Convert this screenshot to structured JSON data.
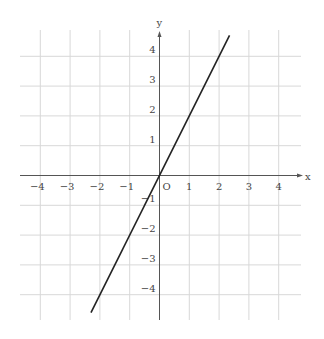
{
  "chart_data": {
    "type": "line",
    "title": "",
    "xlabel": "x",
    "ylabel": "y",
    "origin_label": "O",
    "xlim": [
      -4.6,
      4.7
    ],
    "ylim": [
      -4.7,
      4.6
    ],
    "grid": true,
    "x_ticks": [
      -4,
      -3,
      -2,
      -1,
      1,
      2,
      3,
      4
    ],
    "y_ticks": [
      -4,
      -3,
      -2,
      -1,
      1,
      2,
      3,
      4
    ],
    "x_tick_labels": [
      "−4",
      "−3",
      "−2",
      "−1",
      "1",
      "2",
      "3",
      "4"
    ],
    "y_tick_labels": [
      "−4",
      "−3",
      "−2",
      "−1",
      "1",
      "2",
      "3",
      "4"
    ],
    "series": [
      {
        "name": "y = 2x",
        "x": [
          -2.3,
          2.35
        ],
        "y": [
          -4.6,
          4.7
        ],
        "color": "#222222"
      }
    ]
  },
  "colors": {
    "grid": "#d8d8d8",
    "axis": "#555555",
    "line": "#222222",
    "text": "#444444"
  }
}
